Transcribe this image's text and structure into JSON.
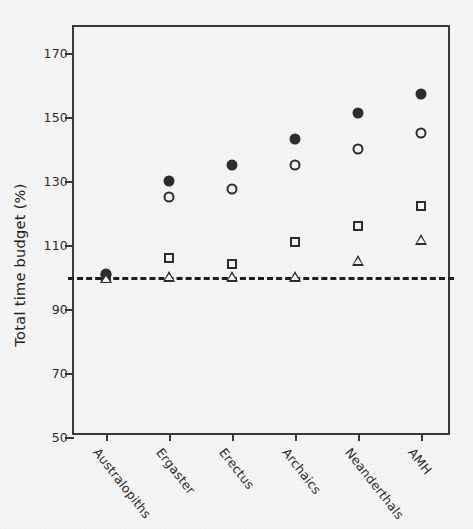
{
  "chart_data": {
    "type": "scatter",
    "title": "",
    "xlabel": "",
    "ylabel": "Total time budget (%)",
    "categories": [
      "Australopiths",
      "Ergaster",
      "Erectus",
      "Archaics",
      "Neanderthals",
      "AMH"
    ],
    "ylim": [
      50,
      178
    ],
    "yticks": [
      50,
      70,
      90,
      110,
      130,
      150,
      170
    ],
    "ytick_labels": [
      "50",
      "70",
      "90",
      "110",
      "130",
      "150",
      "170"
    ],
    "grid": false,
    "legend": "none",
    "reference_line": {
      "value": 100,
      "style": "dashed",
      "color": "#1e1e1e",
      "label": ""
    },
    "series": [
      {
        "name": "filled-circle",
        "marker": "filled circle",
        "values": [
          101,
          130,
          135,
          143,
          151,
          157
        ]
      },
      {
        "name": "open-circle",
        "marker": "open circle",
        "values": [
          100.5,
          125,
          127.5,
          135,
          140,
          145
        ]
      },
      {
        "name": "open-square",
        "marker": "open square",
        "values": [
          100,
          106,
          104,
          111,
          116,
          122
        ]
      },
      {
        "name": "open-triangle",
        "marker": "open triangle",
        "values": [
          99.5,
          100,
          100,
          100,
          105,
          111.5
        ]
      }
    ]
  }
}
